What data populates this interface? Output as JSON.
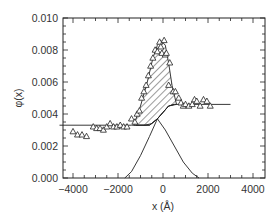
{
  "chart_data": {
    "type": "scatter",
    "title": "",
    "xlabel": "x (Å)",
    "ylabel": "φ(x)",
    "xlim": [
      -4600,
      4600
    ],
    "ylim": [
      0.0,
      0.01
    ],
    "grid": false,
    "legend": null,
    "x_ticks": [
      -4000,
      -2000,
      0,
      2000,
      4000
    ],
    "x_tick_labels": [
      "-4000",
      "-2000",
      "0",
      "2000",
      "4000"
    ],
    "y_ticks": [
      0.0,
      0.002,
      0.004,
      0.006,
      0.008,
      0.01
    ],
    "y_tick_labels": [
      "0.000",
      "0.002",
      "0.004",
      "0.006",
      "0.008",
      "0.010"
    ],
    "series": [
      {
        "name": "measured",
        "marker": "open-triangle",
        "points": [
          [
            -4000,
            0.0029
          ],
          [
            -3800,
            0.0027
          ],
          [
            -3600,
            0.0027
          ],
          [
            -3400,
            0.0026
          ],
          [
            -3100,
            0.0032
          ],
          [
            -2950,
            0.0031
          ],
          [
            -2800,
            0.0031
          ],
          [
            -2650,
            0.003
          ],
          [
            -2500,
            0.0032
          ],
          [
            -2350,
            0.0034
          ],
          [
            -2200,
            0.0032
          ],
          [
            -2050,
            0.0032
          ],
          [
            -1900,
            0.0033
          ],
          [
            -1750,
            0.0032
          ],
          [
            -1600,
            0.0032
          ],
          [
            -1400,
            0.0037
          ],
          [
            -1250,
            0.0035
          ],
          [
            -1150,
            0.004
          ],
          [
            -1050,
            0.0042
          ],
          [
            -950,
            0.005
          ],
          [
            -850,
            0.0054
          ],
          [
            -750,
            0.0058
          ],
          [
            -650,
            0.0064
          ],
          [
            -550,
            0.007
          ],
          [
            -450,
            0.0075
          ],
          [
            -350,
            0.008
          ],
          [
            -250,
            0.0079
          ],
          [
            -150,
            0.0085
          ],
          [
            -100,
            0.0082
          ],
          [
            -50,
            0.0078
          ],
          [
            50,
            0.0086
          ],
          [
            100,
            0.0077
          ],
          [
            150,
            0.0078
          ],
          [
            300,
            0.0072
          ],
          [
            250,
            0.0058
          ],
          [
            450,
            0.0054
          ],
          [
            550,
            0.0054
          ],
          [
            700,
            0.005
          ],
          [
            800,
            0.0047
          ],
          [
            900,
            0.0045
          ],
          [
            1000,
            0.0046
          ],
          [
            1150,
            0.0045
          ],
          [
            1300,
            0.0046
          ],
          [
            1400,
            0.0049
          ],
          [
            1500,
            0.0048
          ],
          [
            1650,
            0.0045
          ],
          [
            1800,
            0.0049
          ],
          [
            1950,
            0.0048
          ],
          [
            2100,
            0.0045
          ]
        ]
      },
      {
        "name": "step-profile",
        "type": "line",
        "points": [
          [
            -4600,
            0.0033
          ],
          [
            -1400,
            0.0033
          ],
          [
            -800,
            0.0033
          ],
          [
            -500,
            0.0034
          ],
          [
            -250,
            0.0037
          ],
          [
            0,
            0.0041
          ],
          [
            250,
            0.0045
          ],
          [
            500,
            0.0046
          ],
          [
            3000,
            0.0046
          ]
        ]
      },
      {
        "name": "rising-sigmoid",
        "type": "line",
        "points": [
          [
            -1700,
            0.0
          ],
          [
            -1400,
            0.0004
          ],
          [
            -1000,
            0.0014
          ],
          [
            -600,
            0.0026
          ],
          [
            -250,
            0.0037
          ],
          [
            0,
            0.0041
          ],
          [
            250,
            0.0045
          ],
          [
            500,
            0.0046
          ]
        ]
      },
      {
        "name": "falling-sigmoid",
        "type": "line",
        "points": [
          [
            -1200,
            0.0033
          ],
          [
            -600,
            0.0033
          ],
          [
            -250,
            0.0037
          ],
          [
            100,
            0.003
          ],
          [
            500,
            0.002
          ],
          [
            900,
            0.001
          ],
          [
            1300,
            0.0003
          ],
          [
            1600,
            0.0
          ]
        ]
      },
      {
        "name": "hatched-excess-region",
        "type": "area",
        "points": [
          [
            -1300,
            0.0033
          ],
          [
            -1000,
            0.0045
          ],
          [
            -700,
            0.006
          ],
          [
            -450,
            0.0075
          ],
          [
            -250,
            0.0083
          ],
          [
            -100,
            0.0086
          ],
          [
            100,
            0.0083
          ],
          [
            250,
            0.0072
          ],
          [
            400,
            0.0058
          ],
          [
            600,
            0.0046
          ],
          [
            250,
            0.0045
          ],
          [
            0,
            0.0041
          ],
          [
            -250,
            0.0037
          ],
          [
            -600,
            0.0033
          ]
        ]
      }
    ]
  }
}
